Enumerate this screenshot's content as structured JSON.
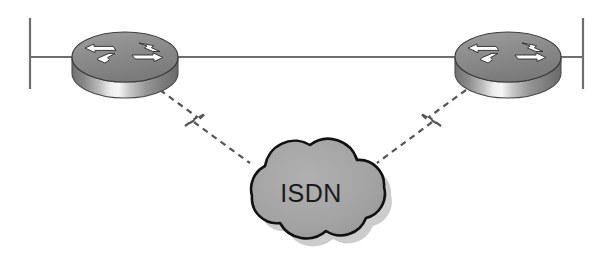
{
  "diagram": {
    "type": "network-topology",
    "background_color": "#ffffff",
    "canvas": {
      "width": 613,
      "height": 258
    },
    "nodes": [
      {
        "id": "router-left",
        "label": "",
        "kind": "router",
        "icon": "cisco-router-icon",
        "x": 125,
        "y": 57,
        "width": 106,
        "height": 70,
        "top_color": "#8c8c8c",
        "body_color": "#7a7a7a",
        "highlight_color": "#f2f2f2",
        "outline_color": "#3d3d3d",
        "arrow_color": "#ffffff"
      },
      {
        "id": "router-right",
        "label": "",
        "kind": "router",
        "icon": "cisco-router-icon",
        "x": 508,
        "y": 57,
        "width": 106,
        "height": 70,
        "top_color": "#8c8c8c",
        "body_color": "#7a7a7a",
        "highlight_color": "#f2f2f2",
        "outline_color": "#3d3d3d",
        "arrow_color": "#ffffff"
      },
      {
        "id": "cloud-isdn",
        "label": "ISDN",
        "kind": "network-cloud",
        "icon": "cloud-icon",
        "x": 314,
        "y": 193,
        "width": 148,
        "height": 87,
        "fill_color": "#a3a3a3",
        "outline_color": "#111111",
        "shadow_color": "#c9c9c9",
        "label_color": "#1a1a1a"
      }
    ],
    "terminators": [
      {
        "id": "terminator-left",
        "x": 30,
        "y_top": 18,
        "y_bottom": 89,
        "color": "#6e6e6e"
      },
      {
        "id": "terminator-right",
        "x": 583,
        "y_top": 18,
        "y_bottom": 89,
        "color": "#6e6e6e"
      }
    ],
    "links": [
      {
        "id": "lan-link-left",
        "style": "solid",
        "color": "#6e6e6e",
        "from": "terminator-left",
        "to": "router-left",
        "x1": 30,
        "y1": 57,
        "x2": 80,
        "y2": 57
      },
      {
        "id": "lan-link-center",
        "style": "solid",
        "color": "#6e6e6e",
        "from": "router-left",
        "to": "router-right",
        "x1": 172,
        "y1": 57,
        "x2": 460,
        "y2": 57
      },
      {
        "id": "lan-link-right",
        "style": "solid",
        "color": "#6e6e6e",
        "from": "router-right",
        "to": "terminator-right",
        "x1": 554,
        "y1": 57,
        "x2": 583,
        "y2": 57
      },
      {
        "id": "isdn-link-left",
        "style": "dashed-lightning",
        "color": "#555555",
        "from": "router-left",
        "to": "cloud-isdn",
        "points": "158,90 196,118 186,126 204,114 196,124 252,164"
      },
      {
        "id": "isdn-link-right",
        "style": "dashed-lightning",
        "color": "#555555",
        "from": "router-right",
        "to": "cloud-isdn",
        "points": "468,90 430,118 440,126 422,114 430,124 376,164"
      }
    ]
  }
}
